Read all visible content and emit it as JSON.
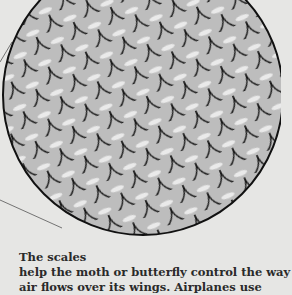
{
  "illustration": {
    "subject": "magnified butterfly/moth wing scales",
    "colors": {
      "background": "#e6e6e4",
      "scale_fill": "#bdbdbd",
      "scale_outline": "#1a1a1a",
      "highlight": "#f2f2f2"
    }
  },
  "caption": {
    "title": "The scales",
    "line1": "help the moth or butterfly control the way",
    "line2": "air flows over its wings. Airplanes use"
  }
}
